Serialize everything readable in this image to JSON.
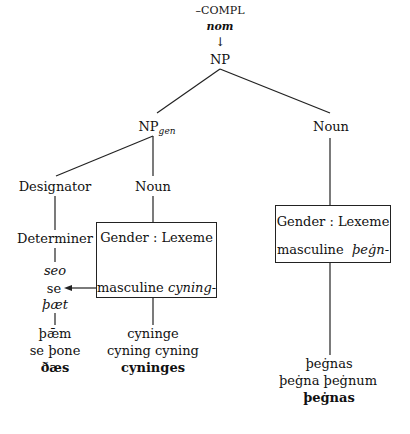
{
  "diagram": {
    "root": {
      "feature": "–COMPL",
      "case": "nom",
      "arrow": "↓",
      "label": "NP"
    },
    "np_gen": {
      "label": "NP",
      "subscript": "gen"
    },
    "designator": {
      "label": "Designator"
    },
    "noun_left": {
      "label": "Noun"
    },
    "noun_right": {
      "label": "Noun"
    },
    "determiner": {
      "label": "Determiner",
      "forms_top": [
        "seo",
        "se",
        "þæt"
      ],
      "forms_bottom": [
        "þǣm",
        "se þone",
        "ðæs"
      ]
    },
    "left_box": {
      "header": "Gender : Lexeme",
      "gender": "masculine",
      "lexeme": "cyning-",
      "forms": [
        "cyninge",
        "cyning cyning",
        "cyninges"
      ]
    },
    "right_box": {
      "header": "Gender : Lexeme",
      "gender": "masculine",
      "lexeme": "þeġn-",
      "forms": [
        "þeġnas",
        "þeġna þeġnum",
        "þeġnas"
      ]
    }
  }
}
